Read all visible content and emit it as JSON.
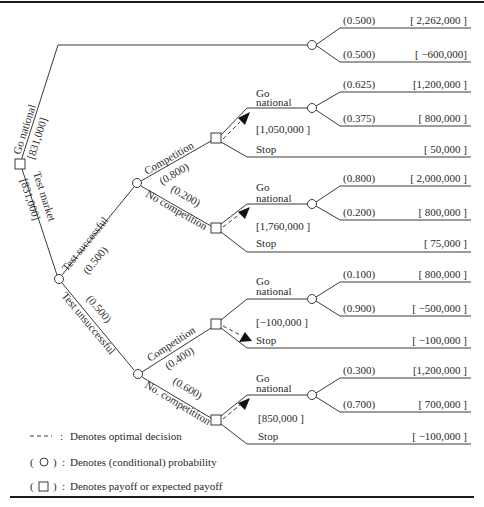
{
  "diagram": {
    "type": "decision-tree",
    "root": {
      "expected_payoff_go_national": "[831,000]",
      "expected_payoff_test_market": "[831,000]",
      "branches": {
        "go_national": {
          "label": "Go national",
          "outcomes": [
            {
              "prob": "(0.500)",
              "payoff": "[ 2,262,000 ]"
            },
            {
              "prob": "(0.500)",
              "payoff": "[ −600,000]"
            }
          ]
        },
        "test_market": {
          "label": "Test market",
          "successful": {
            "label": "Test successful",
            "prob": "(0.500)",
            "competition": {
              "label": "Competition",
              "prob": "(0.800)",
              "decision_value": "[1,050,000 ]",
              "go_label_1": "Go",
              "go_label_2": "national",
              "stop_label": "Stop",
              "outcomes": [
                {
                  "prob": "(0.625)",
                  "payoff": "[1,200,000 ]"
                },
                {
                  "prob": "(0.375)",
                  "payoff": "[ 800,000 ]"
                }
              ],
              "stop_payoff": "[ 50,000 ]"
            },
            "no_competition": {
              "label": "No competition",
              "prob": "(0.200)",
              "decision_value": "[1,760,000 ]",
              "go_label_1": "Go",
              "go_label_2": "national",
              "stop_label": "Stop",
              "outcomes": [
                {
                  "prob": "(0.800)",
                  "payoff": "[ 2,000,000 ]"
                },
                {
                  "prob": "(0.200)",
                  "payoff": "[ 800,000 ]"
                }
              ],
              "stop_payoff": "[ 75,000 ]"
            }
          },
          "unsuccessful": {
            "label": "Test unsuccessful",
            "prob": "(0.500)",
            "competition": {
              "label": "Competition",
              "prob": "(0.400)",
              "decision_value": "[−100,000 ]",
              "go_label_1": "Go",
              "go_label_2": "national",
              "stop_label": "Stop",
              "outcomes": [
                {
                  "prob": "(0.100)",
                  "payoff": "[ 800,000 ]"
                },
                {
                  "prob": "(0.900)",
                  "payoff": "[ −500,000 ]"
                }
              ],
              "stop_payoff": "[ −100,000 ]"
            },
            "no_competition": {
              "label": "No. competititon",
              "prob": "(0.600)",
              "decision_value": "[850,000 ]",
              "go_label_1": "Go",
              "go_label_2": "national",
              "stop_label": "Stop",
              "outcomes": [
                {
                  "prob": "(0.300)",
                  "payoff": "[1,200,000 ]"
                },
                {
                  "prob": "(0.700)",
                  "payoff": "[ 700,000 ]"
                }
              ],
              "stop_payoff": "[ −100,000 ]"
            }
          }
        }
      }
    }
  },
  "legend": [
    {
      "symbol": "- - -",
      "sep": ":",
      "text": "Denotes optimal decision"
    },
    {
      "symbol": "( ○ )",
      "sep": ":",
      "text": "Denotes (conditional) probability"
    },
    {
      "symbol": "( □ )",
      "sep": ":",
      "text": "Denotes payoff or expected payoff"
    }
  ]
}
